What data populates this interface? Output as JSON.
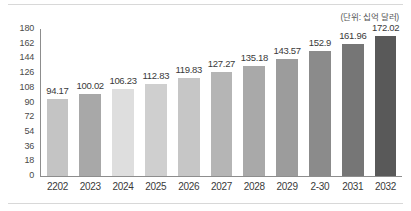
{
  "caption": {
    "unit_note": "(단위: 십억 달러)"
  },
  "chart_data": {
    "type": "bar",
    "title": "",
    "subtitle": "",
    "xlabel": "",
    "ylabel": "",
    "unit_note": "(단위: 십억 달러)",
    "categories": [
      "2202",
      "2023",
      "2024",
      "2025",
      "2026",
      "2027",
      "2028",
      "2029",
      "2-30",
      "2031",
      "2032"
    ],
    "values": [
      94.17,
      100.02,
      106.23,
      112.83,
      119.83,
      127.27,
      135.18,
      143.57,
      152.9,
      161.96,
      172.02
    ],
    "value_labels": [
      "94.17",
      "100.02",
      "106.23",
      "112.83",
      "119.83",
      "127.27",
      "135.18",
      "143.57",
      "152.9",
      "161.96",
      "172.02"
    ],
    "bar_colors": [
      "#c4c4c4",
      "#a8a8a8",
      "#dedede",
      "#cfcfcf",
      "#c6c6c6",
      "#b5b5b5",
      "#a9a9a9",
      "#9c9c9c",
      "#8b8b8b",
      "#767676",
      "#595959"
    ],
    "ylim": [
      0,
      180
    ],
    "yticks": [
      180,
      162,
      144,
      126,
      108,
      90,
      72,
      54,
      36,
      18,
      0
    ],
    "ytick_labels": [
      "180",
      "162",
      "144",
      "126",
      "108",
      "90",
      "72",
      "54",
      "36",
      "18",
      "0"
    ],
    "grid": false,
    "legend": null,
    "legend_position": "none",
    "axis_color": "#8d8d8d",
    "text_color": "#3a3a3a"
  }
}
